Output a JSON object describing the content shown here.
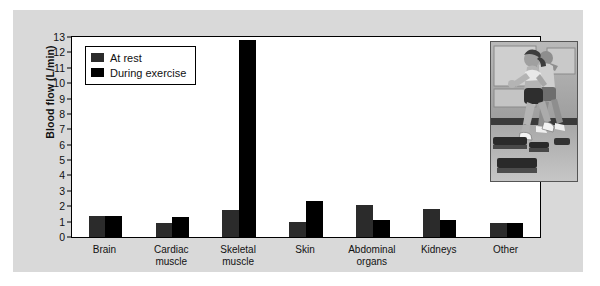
{
  "chart_data": {
    "type": "bar",
    "title": "",
    "xlabel": "",
    "ylabel": "Blood flow (L/min)",
    "ylim": [
      0,
      13
    ],
    "ytick_labels": [
      "0",
      "1",
      "2",
      "3",
      "4",
      "5",
      "6",
      "7",
      "8",
      "9",
      "10",
      "11",
      "12",
      "13"
    ],
    "grid": false,
    "legend_position": "top-left inside plot",
    "categories": [
      "Brain",
      "Cardiac muscle",
      "Skeletal muscle",
      "Skin",
      "Abdominal organs",
      "Kidneys",
      "Other"
    ],
    "category_lines": [
      [
        "Brain"
      ],
      [
        "Cardiac",
        "muscle"
      ],
      [
        "Skeletal",
        "muscle"
      ],
      [
        "Skin"
      ],
      [
        "Abdominal",
        "organs"
      ],
      [
        "Kidneys"
      ],
      [
        "Other"
      ]
    ],
    "series": [
      {
        "name": "At rest",
        "color": "#2b2b2b",
        "values": [
          1.35,
          0.9,
          1.75,
          1.0,
          2.1,
          1.8,
          0.9
        ]
      },
      {
        "name": "During exercise",
        "color": "#000000",
        "values": [
          1.35,
          1.3,
          12.8,
          2.35,
          1.1,
          1.1,
          0.9
        ]
      }
    ]
  },
  "legend": {
    "items": [
      {
        "label": "At rest",
        "swatch": "rest"
      },
      {
        "label": "During exercise",
        "swatch": "exercise"
      }
    ]
  },
  "photo": {
    "name": "step-aerobics-photo",
    "caption": "Two women exercising on step platforms in a gym"
  },
  "colors": {
    "panel_background": "#d9d9d9",
    "plot_background": "#ffffff",
    "at_rest_bar": "#2b2b2b",
    "during_exercise_bar": "#000000",
    "axis": "#000000",
    "text": "#111111"
  }
}
